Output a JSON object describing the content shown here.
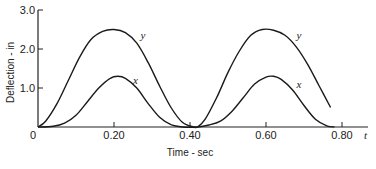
{
  "chart_data": {
    "type": "line",
    "title": "",
    "xlabel": "Time - sec",
    "ylabel": "Deflection - in",
    "x_axis_symbol": "t",
    "xlim": [
      0,
      0.85
    ],
    "ylim": [
      0,
      3.0
    ],
    "x_ticks": [
      "0",
      "0.20",
      "0.40",
      "0.60",
      "0.80"
    ],
    "y_ticks": [
      "1.0",
      "2.0",
      "3.0"
    ],
    "grid": false,
    "legend": "inline labels",
    "series": [
      {
        "name": "y",
        "x": [
          0,
          0.02,
          0.05,
          0.08,
          0.11,
          0.14,
          0.17,
          0.2,
          0.23,
          0.26,
          0.29,
          0.32,
          0.35,
          0.38,
          0.41,
          0.42,
          0.44,
          0.47,
          0.5,
          0.53,
          0.56,
          0.59,
          0.62,
          0.65,
          0.68,
          0.71,
          0.74,
          0.77
        ],
        "values": [
          0,
          0.15,
          0.6,
          1.2,
          1.8,
          2.25,
          2.45,
          2.5,
          2.42,
          2.15,
          1.65,
          1.05,
          0.5,
          0.12,
          0.0,
          0.0,
          0.2,
          0.75,
          1.4,
          1.95,
          2.35,
          2.5,
          2.48,
          2.35,
          2.05,
          1.6,
          1.05,
          0.5
        ]
      },
      {
        "name": "x",
        "x": [
          0,
          0.04,
          0.07,
          0.1,
          0.13,
          0.16,
          0.19,
          0.21,
          0.23,
          0.26,
          0.29,
          0.32,
          0.35,
          0.38,
          0.42,
          0.45,
          0.48,
          0.51,
          0.54,
          0.57,
          0.6,
          0.62,
          0.64,
          0.67,
          0.7,
          0.73,
          0.76,
          0.78
        ],
        "values": [
          0,
          0.02,
          0.1,
          0.3,
          0.65,
          1.0,
          1.25,
          1.3,
          1.25,
          1.0,
          0.6,
          0.25,
          0.06,
          0.0,
          0.0,
          0.05,
          0.15,
          0.4,
          0.75,
          1.1,
          1.28,
          1.3,
          1.22,
          0.95,
          0.55,
          0.2,
          0.03,
          0.0
        ]
      }
    ],
    "annotations": [
      {
        "text": "y",
        "x": 0.27,
        "y": 2.25
      },
      {
        "text": "x",
        "x": 0.25,
        "y": 1.1
      },
      {
        "text": "y",
        "x": 0.68,
        "y": 2.25
      },
      {
        "text": "x",
        "x": 0.68,
        "y": 1.0
      }
    ]
  }
}
